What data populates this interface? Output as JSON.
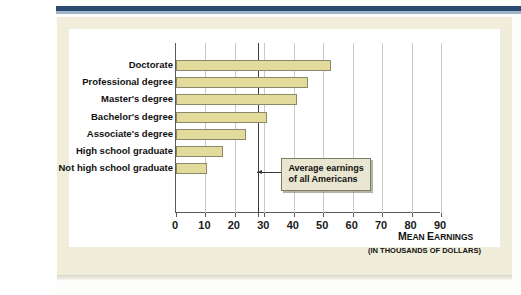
{
  "figure": {
    "background_color": "#f0eedb",
    "bar_color": "#e3db9c",
    "accent_band_color": "#2b4a6f"
  },
  "callout": {
    "line1": "Average earnings",
    "line2": "of all Americans",
    "value": 28
  },
  "axis_titles": {
    "main_first_letter": "M",
    "main_rest": "EAN ",
    "main_second_letter": "E",
    "main_tail": "ARNINGS",
    "main_full": "MEAN EARNINGS",
    "sub": "(IN THOUSANDS OF DOLLARS)"
  },
  "chart_data": {
    "type": "bar",
    "orientation": "horizontal",
    "title": "",
    "xlabel": "MEAN EARNINGS (IN THOUSANDS OF DOLLARS)",
    "ylabel": "",
    "xlim": [
      0,
      90
    ],
    "xticks": [
      0,
      10,
      20,
      30,
      40,
      50,
      60,
      70,
      80,
      90
    ],
    "xtick_labels": [
      "0",
      "10",
      "20",
      "30",
      "40",
      "50",
      "60",
      "70",
      "80",
      "90"
    ],
    "grid": true,
    "legend": null,
    "categories": [
      "Doctorate",
      "Professional degree",
      "Master's degree",
      "Bachelor's degree",
      "Associate's degree",
      "High school graduate",
      "Not high school graduate"
    ],
    "values": [
      52.5,
      44.7,
      41.0,
      30.8,
      23.9,
      16.0,
      10.5
    ],
    "annotations": [
      {
        "label": "Average earnings of all Americans",
        "x": 28,
        "type": "vertical-line"
      }
    ]
  }
}
